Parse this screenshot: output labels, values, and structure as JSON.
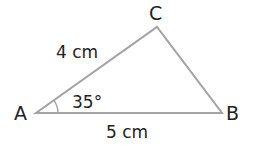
{
  "diagram": {
    "type": "triangle",
    "vertices": {
      "A": {
        "label": "A",
        "x": 36,
        "y": 113
      },
      "B": {
        "label": "B",
        "x": 222,
        "y": 113
      },
      "C": {
        "label": "C",
        "x": 157,
        "y": 27
      }
    },
    "sides": {
      "AC": {
        "label": "4 cm"
      },
      "AB": {
        "label": "5 cm"
      }
    },
    "angles": {
      "A": {
        "label": "35°"
      }
    },
    "colors": {
      "line": "#a3a3a3",
      "text": "#222222"
    }
  }
}
